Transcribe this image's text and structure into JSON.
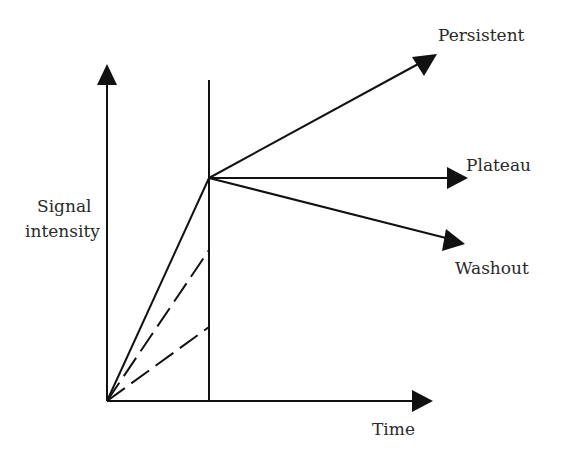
{
  "diagram": {
    "title": "",
    "y_axis_label_line1": "Signal",
    "y_axis_label_line2": "intensity",
    "x_axis_label": "Time",
    "curves": [
      {
        "name": "Persistent",
        "label": "Persistent",
        "style": "solid",
        "direction": "rising"
      },
      {
        "name": "Plateau",
        "label": "Plateau",
        "style": "solid",
        "direction": "flat"
      },
      {
        "name": "Washout",
        "label": "Washout",
        "style": "solid",
        "direction": "falling"
      }
    ],
    "initial_uptake_lines": [
      {
        "style": "solid",
        "level": "high"
      },
      {
        "style": "dashed",
        "level": "medium"
      },
      {
        "style": "dashed",
        "level": "low"
      }
    ],
    "colors": {
      "line": "#111111",
      "text": "#2a2a2a",
      "background": "#ffffff"
    }
  }
}
